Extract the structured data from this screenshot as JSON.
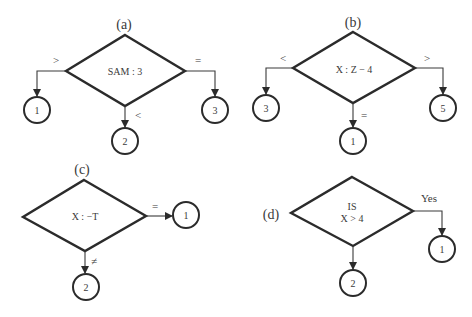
{
  "diagram": {
    "type": "flowchart-decision-examples",
    "panels": [
      {
        "id": "a",
        "label": "(a)",
        "condition": "SAM : 3",
        "branches": [
          {
            "direction": "left",
            "symbol": ">",
            "target": "1"
          },
          {
            "direction": "bottom",
            "symbol": "<",
            "target": "2"
          },
          {
            "direction": "right",
            "symbol": "=",
            "target": "3"
          }
        ]
      },
      {
        "id": "b",
        "label": "(b)",
        "condition": "X : Z − 4",
        "branches": [
          {
            "direction": "left",
            "symbol": "<",
            "target": "3"
          },
          {
            "direction": "bottom",
            "symbol": "=",
            "target": "1"
          },
          {
            "direction": "right",
            "symbol": ">",
            "target": "5"
          }
        ]
      },
      {
        "id": "c",
        "label": "(c)",
        "condition": "X : −T",
        "branches": [
          {
            "direction": "right",
            "symbol": "=",
            "target": "1"
          },
          {
            "direction": "bottom",
            "symbol": "≠",
            "target": "2"
          }
        ]
      },
      {
        "id": "d",
        "label": "(d)",
        "condition_line1": "IS",
        "condition_line2": "X > 4",
        "branches": [
          {
            "direction": "right",
            "symbol": "Yes",
            "target": "1"
          },
          {
            "direction": "bottom",
            "symbol": "",
            "target": "2"
          }
        ]
      }
    ]
  }
}
